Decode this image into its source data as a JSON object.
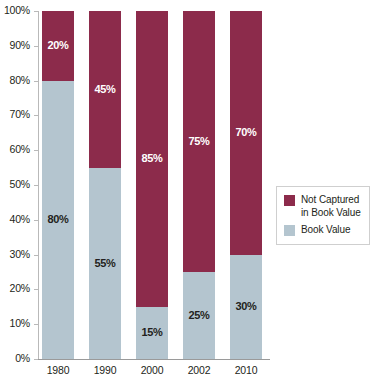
{
  "chart_data": {
    "type": "bar",
    "subtype": "stacked-bar-100-percent",
    "title": "",
    "subtitle": "",
    "xlabel": "",
    "ylabel": "",
    "categories": [
      "1980",
      "1990",
      "2000",
      "2002",
      "2010"
    ],
    "series": [
      {
        "name": "Not Captured in Book Value",
        "color": "#8c2b4b",
        "values": [
          20,
          45,
          85,
          75,
          70
        ],
        "labels": [
          "20%",
          "45%",
          "85%",
          "75%",
          "70%"
        ]
      },
      {
        "name": "Book Value",
        "color": "#b4c5cf",
        "values": [
          80,
          55,
          15,
          25,
          30
        ],
        "labels": [
          "80%",
          "55%",
          "15%",
          "25%",
          "30%"
        ]
      }
    ],
    "stack_order_bottom_to_top": [
      "Book Value",
      "Not Captured in Book Value"
    ],
    "ylim": [
      0,
      100
    ],
    "yticks": [
      0,
      10,
      20,
      30,
      40,
      50,
      60,
      70,
      80,
      90,
      100
    ],
    "ytick_labels": [
      "0%",
      "10%",
      "20%",
      "30%",
      "40%",
      "50%",
      "60%",
      "70%",
      "80%",
      "90%",
      "100%"
    ],
    "grid": false,
    "legend_position": "right",
    "legend": [
      {
        "label": "Not Captured in Book Value",
        "color": "#8c2b4b"
      },
      {
        "label": "Book Value",
        "color": "#b4c5cf"
      }
    ],
    "annotations": []
  },
  "colors": {
    "not_captured": "#8c2b4b",
    "book_value": "#b4c5cf",
    "axis": "#b9b9b9",
    "baseline": "#9a9a9a",
    "text": "#231f20",
    "legend_border": "#cfcfcf",
    "background": "#ffffff"
  }
}
